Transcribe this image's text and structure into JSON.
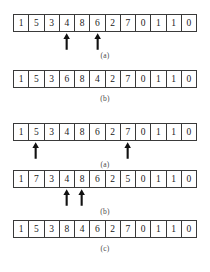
{
  "figure": {
    "cell_count": 12,
    "colors": {
      "border": "#3a3a3a",
      "text": "#1a1a1a",
      "arrow": "#111111",
      "background": "#ffffff"
    },
    "rows": [
      {
        "id": "row-1",
        "values": [
          "1",
          "5",
          "3",
          "4",
          "8",
          "6",
          "2",
          "7",
          "0",
          "1",
          "1",
          "0"
        ],
        "arrows": [
          3,
          5
        ],
        "label": "(a)"
      },
      {
        "id": "row-2",
        "values": [
          "1",
          "5",
          "3",
          "6",
          "8",
          "4",
          "2",
          "7",
          "0",
          "1",
          "1",
          "0"
        ],
        "arrows": [],
        "label": "(b)"
      },
      {
        "id": "row-3",
        "values": [
          "1",
          "5",
          "3",
          "4",
          "8",
          "6",
          "2",
          "7",
          "0",
          "1",
          "1",
          "0"
        ],
        "arrows": [
          1,
          7
        ],
        "label": "(a)"
      },
      {
        "id": "row-4",
        "values": [
          "1",
          "7",
          "3",
          "4",
          "8",
          "6",
          "2",
          "5",
          "0",
          "1",
          "1",
          "0"
        ],
        "arrows": [
          3,
          4
        ],
        "label": "(b)"
      },
      {
        "id": "row-5",
        "values": [
          "1",
          "5",
          "3",
          "8",
          "4",
          "6",
          "2",
          "7",
          "0",
          "1",
          "1",
          "0"
        ],
        "arrows": [],
        "label": "(c)"
      }
    ]
  }
}
